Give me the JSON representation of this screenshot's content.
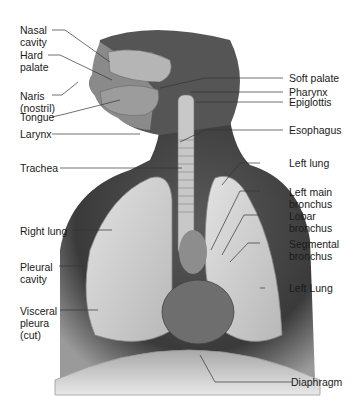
{
  "diagram": {
    "type": "anatomical illustration",
    "labels_left": [
      {
        "id": "nasal-cavity",
        "text": "Nasal\ncavity"
      },
      {
        "id": "hard-palate",
        "text": "Hard\npalate"
      },
      {
        "id": "naris",
        "text": "Naris\n(nostril)"
      },
      {
        "id": "tongue",
        "text": "Tongue"
      },
      {
        "id": "larynx",
        "text": "Larynx"
      },
      {
        "id": "trachea",
        "text": "Trachea"
      },
      {
        "id": "right-lung",
        "text": "Right lung"
      },
      {
        "id": "pleural-cavity",
        "text": "Pleural\ncavity"
      },
      {
        "id": "visceral-pleura",
        "text": "Visceral\npleura\n(cut)"
      }
    ],
    "labels_right": [
      {
        "id": "soft-palate",
        "text": "Soft palate"
      },
      {
        "id": "pharynx",
        "text": "Pharynx"
      },
      {
        "id": "epiglottis",
        "text": "Epiglottis"
      },
      {
        "id": "esophagus",
        "text": "Esophagus"
      },
      {
        "id": "left-lung",
        "text": "Left lung"
      },
      {
        "id": "left-main-bronchus",
        "text": "Left main\nbronchus"
      },
      {
        "id": "lobar-bronchus",
        "text": "Lobar\nbronchus"
      },
      {
        "id": "segmental-bronchus",
        "text": "Segmental\nbronchus"
      },
      {
        "id": "left-lung-lower",
        "text": "Left Lung"
      },
      {
        "id": "diaphragm",
        "text": "Diaphragm"
      }
    ]
  },
  "colors": {
    "background": "#ffffff",
    "body_dark": "#4a4a4a",
    "lung": "#cfcfcf",
    "leader_line": "#333333",
    "label_text": "#1a1a1a"
  }
}
